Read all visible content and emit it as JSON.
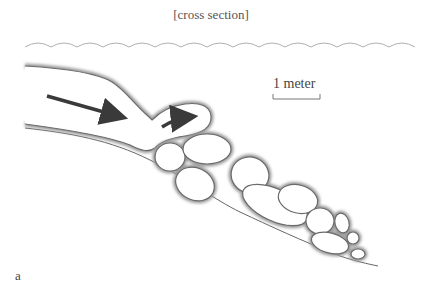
{
  "figure": {
    "title": "[cross section]",
    "scale_bar_label": "1 meter",
    "panel_label": "a"
  },
  "colors": {
    "outline": "#6a6a6a",
    "shadow": "#9a9a9a",
    "arrow": "#3a3a3a",
    "water_line": "#b0b0b0",
    "text": "#555555"
  }
}
